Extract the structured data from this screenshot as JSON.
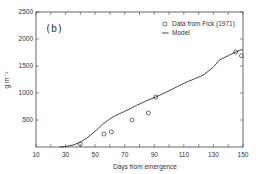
{
  "chart_data": {
    "type": "line",
    "title": "",
    "panel_label": "(b)",
    "xlabel": "Days from emergence",
    "ylabel": "g m⁻²",
    "xlim": [
      10,
      150
    ],
    "ylim": [
      0,
      2500
    ],
    "xticks": [
      10,
      30,
      50,
      70,
      90,
      110,
      130,
      150
    ],
    "yticks": [
      500,
      1000,
      1500,
      2000,
      2500
    ],
    "grid": false,
    "legend_position": "upper right",
    "series": [
      {
        "name": "Data from Fick (1971)",
        "kind": "scatter",
        "marker": "open-circle",
        "x": [
          40,
          56,
          61,
          75,
          86,
          91,
          145,
          149
        ],
        "y": [
          55,
          240,
          280,
          500,
          630,
          925,
          1760,
          1690
        ]
      },
      {
        "name": "Model",
        "kind": "line",
        "x": [
          26,
          30,
          35,
          40,
          45,
          50,
          55,
          60,
          65,
          70,
          78,
          85,
          91,
          100,
          110,
          123,
          130,
          134,
          140,
          145,
          150
        ],
        "y": [
          0,
          10,
          35,
          90,
          180,
          290,
          420,
          520,
          600,
          660,
          770,
          860,
          925,
          1040,
          1180,
          1330,
          1480,
          1610,
          1690,
          1760,
          1810
        ]
      }
    ]
  },
  "colors": {
    "axis": "#444444",
    "line": "#333333",
    "marker": "#333333",
    "background": "#ffffff"
  }
}
